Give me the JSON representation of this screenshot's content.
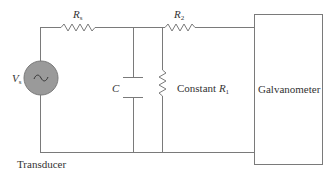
{
  "diagram": {
    "type": "circuit",
    "colors": {
      "wire": "#7a7a7a",
      "source_fill": "#9a9a9a",
      "text": "#333333",
      "background": "#ffffff"
    },
    "source": {
      "symbol": "V",
      "subscript": "s",
      "glyph": "~"
    },
    "resistor_source": {
      "symbol": "R",
      "subscript": "s"
    },
    "resistor_2": {
      "symbol": "R",
      "subscript": "2"
    },
    "capacitor": {
      "symbol": "C"
    },
    "resistor_1": {
      "prefix": "Constant ",
      "symbol": "R",
      "subscript": "1"
    },
    "galvanometer": {
      "label": "Galvanometer"
    },
    "transducer": {
      "label": "Transducer"
    }
  }
}
